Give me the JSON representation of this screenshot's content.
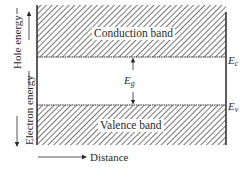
{
  "bands": {
    "conduction": {
      "label": "Conduction band",
      "edge_symbol": "E",
      "edge_sub": "c"
    },
    "valence": {
      "label": "Valence band",
      "edge_symbol": "E",
      "edge_sub": "v"
    }
  },
  "gap": {
    "symbol": "E",
    "sub": "g"
  },
  "axes": {
    "vertical_up_label": "Hole energy",
    "vertical_down_label": "Electron energy",
    "horizontal_label": "Distance"
  },
  "colors": {
    "line": "#2a2a2a",
    "hatch": "#555555",
    "background": "#ffffff"
  }
}
